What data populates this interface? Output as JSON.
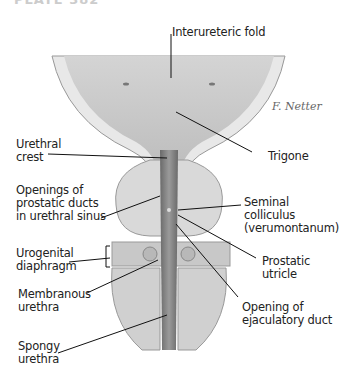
{
  "header": {
    "title_partial": "PLATE 382"
  },
  "diagram": {
    "signature": "F. Netter",
    "labels": {
      "interureteric_fold": "Interureteric fold",
      "trigone": "Trigone",
      "urethral_crest": "Urethral\ncrest",
      "openings_prostatic": "Openings of\nprostatic ducts\nin urethral sinus",
      "seminal_colliculus": "Seminal\ncolliculus\n(verumontanum)",
      "prostatic_utricle": "Prostatic\nutricle",
      "urogenital_diaphragm": "Urogenital\ndiaphragm",
      "membranous_urethra": "Membranous\nurethra",
      "opening_ejaculatory": "Opening of\nejaculatory duct",
      "spongy_urethra": "Spongy\nurethra"
    }
  }
}
